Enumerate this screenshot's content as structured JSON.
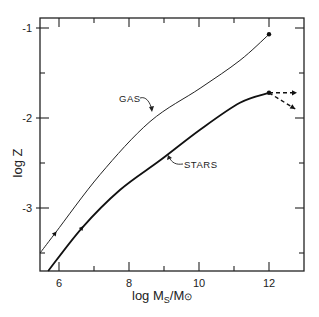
{
  "chart_data": {
    "type": "line",
    "title": "",
    "xlabel": "log M_S/M_⊙",
    "ylabel": "log Z",
    "xlim": [
      5.46,
      13.0
    ],
    "ylim": [
      -3.81,
      -0.89
    ],
    "grid": false,
    "legend": "inline labels",
    "x_ticks": [
      6,
      8,
      10,
      12
    ],
    "x_minor_ticks": [
      7,
      9,
      11
    ],
    "y_ticks": [
      -1,
      -2,
      -3
    ],
    "y_minor_ticks": [
      -1.5,
      -2.5,
      -3.5
    ],
    "series": [
      {
        "name": "GAS",
        "style": "thin solid",
        "x": [
          5.46,
          5.89,
          7.17,
          8.6,
          10.03,
          11.17,
          12.0
        ],
        "y": [
          -3.5,
          -3.28,
          -2.63,
          -2.04,
          -1.67,
          -1.36,
          -1.07
        ],
        "endpoint_marker": {
          "x": 12.0,
          "y": -1.07
        },
        "direction_arrow_at": {
          "x": 5.89,
          "y": -3.28
        }
      },
      {
        "name": "STARS",
        "style": "thick solid",
        "x": [
          5.69,
          6.66,
          7.74,
          8.89,
          10.03,
          11.17,
          12.0
        ],
        "y": [
          -3.7,
          -3.22,
          -2.8,
          -2.47,
          -2.13,
          -1.83,
          -1.72
        ],
        "endpoint_marker": {
          "x": 12.0,
          "y": -1.72
        },
        "direction_arrow_at": {
          "x": 6.66,
          "y": -3.22
        },
        "dashed_continuations": [
          {
            "to_x": 12.8,
            "to_y": -1.72
          },
          {
            "to_x": 12.75,
            "to_y": -1.9
          }
        ]
      }
    ],
    "annotations": [
      {
        "text": "GAS",
        "x": 7.9,
        "y": -1.78
      },
      {
        "text": "STARS",
        "x": 9.2,
        "y": -2.53
      }
    ]
  },
  "labels": {
    "x_axis": "log M",
    "x_axis_sub": "S",
    "x_axis_tail": "/M",
    "x_axis_sun": "⊙",
    "y_axis": "log Z",
    "x_tick_labels": [
      "6",
      "8",
      "10",
      "12"
    ],
    "y_tick_labels": [
      "-1",
      "-2",
      "-3"
    ],
    "gas": "GAS",
    "stars": "STARS"
  }
}
